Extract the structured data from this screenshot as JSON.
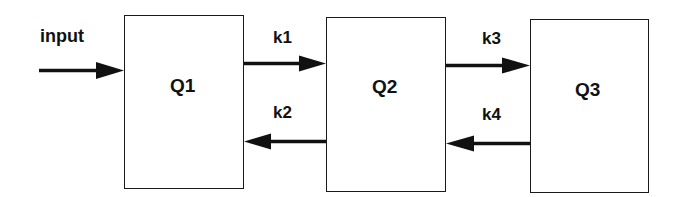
{
  "diagram": {
    "type": "compartment-model",
    "colors": {
      "background": "#ffffff",
      "stroke": "#1a1a1a",
      "text": "#111111"
    },
    "input": {
      "label": "input",
      "target": "Q1"
    },
    "nodes": [
      {
        "id": "Q1",
        "label": "Q1"
      },
      {
        "id": "Q2",
        "label": "Q2"
      },
      {
        "id": "Q3",
        "label": "Q3"
      }
    ],
    "edges": [
      {
        "id": "k1",
        "label": "k1",
        "from": "Q1",
        "to": "Q2"
      },
      {
        "id": "k2",
        "label": "k2",
        "from": "Q2",
        "to": "Q1"
      },
      {
        "id": "k3",
        "label": "k3",
        "from": "Q2",
        "to": "Q3"
      },
      {
        "id": "k4",
        "label": "k4",
        "from": "Q3",
        "to": "Q2"
      }
    ]
  }
}
